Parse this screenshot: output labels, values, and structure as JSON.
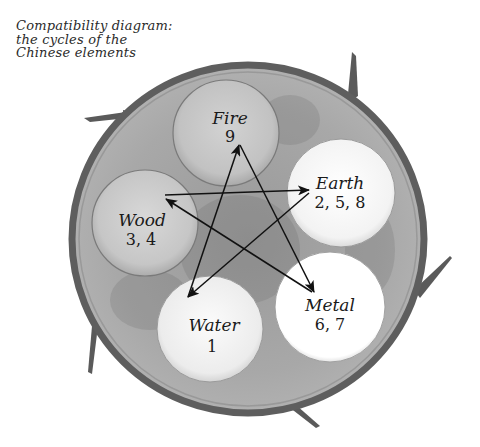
{
  "caption": {
    "line1": "Compatibility diagram:",
    "line2": "the cycles of the",
    "line3": "Chinese elements"
  },
  "colors": {
    "outer_rim": "#5e5e5e",
    "outer_fill": "#a6a6a6",
    "branch": "#5a5a5a",
    "arrow": "#111111",
    "fire_fill": "#c4c4c4",
    "wood_fill": "#c8c8c8",
    "earth_fill": "#f7f7f7",
    "water_fill": "#f0f0f0",
    "metal_fill": "#ffffff"
  },
  "elements": {
    "fire": {
      "name": "Fire",
      "numbers": "9"
    },
    "earth": {
      "name": "Earth",
      "numbers": "2, 5, 8"
    },
    "metal": {
      "name": "Metal",
      "numbers": "6, 7"
    },
    "water": {
      "name": "Water",
      "numbers": "1"
    },
    "wood": {
      "name": "Wood",
      "numbers": "3, 4"
    }
  },
  "cycle_arrows": [
    {
      "from": "Wood",
      "to": "Earth"
    },
    {
      "from": "Earth",
      "to": "Water"
    },
    {
      "from": "Water",
      "to": "Fire"
    },
    {
      "from": "Fire",
      "to": "Metal"
    },
    {
      "from": "Metal",
      "to": "Wood"
    }
  ]
}
